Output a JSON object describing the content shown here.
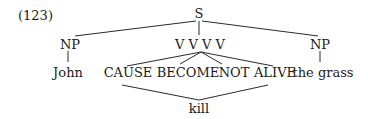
{
  "example_number": "(123)",
  "tree": {
    "root": "S",
    "level1": {
      "left": "NP",
      "middle": "V V V V",
      "right": "NP"
    },
    "level2": {
      "subject": "John",
      "predicates": [
        "CAUSE",
        "BECOME",
        "NOT",
        "ALIVE"
      ],
      "object": "the grass"
    },
    "lexicalization": "kill"
  }
}
